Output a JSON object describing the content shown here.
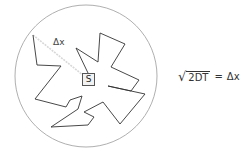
{
  "diagram": {
    "source_label": "S",
    "displacement_label": "Δx",
    "formula": {
      "radicand": "2DT",
      "equals": "=",
      "rhs": "Δx"
    },
    "colors": {
      "circle": "#9a9a9a",
      "path": "#333333",
      "dashed": "#cfcfcf"
    }
  }
}
